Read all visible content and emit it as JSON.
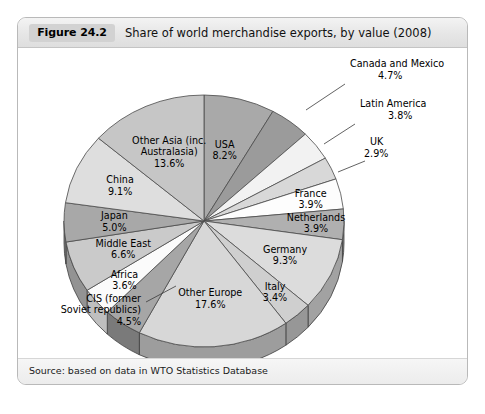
{
  "figure": {
    "number_label": "Figure 24.2",
    "title": "Share of world merchandise exports, by value (2008)",
    "source": "Source: based on data in WTO Statistics Database"
  },
  "chart_data": {
    "type": "pie",
    "title": "Share of world merchandise exports, by value (2008)",
    "value_unit": "%",
    "style": "3d-pie",
    "start_angle_deg": 0,
    "direction": "clockwise",
    "legend": "none (direct labels)",
    "categories": [
      "USA",
      "Canada and Mexico",
      "Latin America",
      "UK",
      "France",
      "Netherlands",
      "Germany",
      "Italy",
      "Other Europe",
      "CIS (former Soviet republics)",
      "Africa",
      "Middle East",
      "Japan",
      "China",
      "Other Asia (inc. Australasia)"
    ],
    "values": [
      8.2,
      4.7,
      3.8,
      2.9,
      3.9,
      3.9,
      9.3,
      3.4,
      17.6,
      4.5,
      3.6,
      6.6,
      5.0,
      9.1,
      13.6
    ],
    "slices": [
      {
        "name": "USA",
        "value": 8.2,
        "value_text": "8.2%",
        "label_lines": [
          "USA",
          "8.2%"
        ],
        "color": "#a9a9a9",
        "side_color": "#7d7d7d",
        "placement": "inside"
      },
      {
        "name": "Canada and Mexico",
        "value": 4.7,
        "value_text": "4.7%",
        "label_lines": [
          "Canada and Mexico",
          "4.7%"
        ],
        "color": "#9b9b9b",
        "side_color": "#717171",
        "placement": "callout"
      },
      {
        "name": "Latin America",
        "value": 3.8,
        "value_text": "3.8%",
        "label_lines": [
          "Latin America",
          "3.8%"
        ],
        "color": "#f2f2f2",
        "side_color": "#b7b7b7",
        "placement": "callout"
      },
      {
        "name": "UK",
        "value": 2.9,
        "value_text": "2.9%",
        "label_lines": [
          "UK",
          "2.9%"
        ],
        "color": "#d8d8d8",
        "side_color": "#9e9e9e",
        "placement": "callout"
      },
      {
        "name": "France",
        "value": 3.9,
        "value_text": "3.9%",
        "label_lines": [
          "France",
          "3.9%"
        ],
        "color": "#fdfdfd",
        "side_color": "#c0c0c0",
        "placement": "inside"
      },
      {
        "name": "Netherlands",
        "value": 3.9,
        "value_text": "3.9%",
        "label_lines": [
          "Netherlands",
          "3.9%"
        ],
        "color": "#b0b0b0",
        "side_color": "#848484",
        "placement": "inside"
      },
      {
        "name": "Germany",
        "value": 9.3,
        "value_text": "9.3%",
        "label_lines": [
          "Germany",
          "9.3%"
        ],
        "color": "#dcdcdc",
        "side_color": "#a2a2a2",
        "placement": "inside"
      },
      {
        "name": "Italy",
        "value": 3.4,
        "value_text": "3.4%",
        "label_lines": [
          "Italy",
          "3.4%"
        ],
        "color": "#cfcfcf",
        "side_color": "#979797",
        "placement": "inside"
      },
      {
        "name": "Other Europe",
        "value": 17.6,
        "value_text": "17.6%",
        "label_lines": [
          "Other Europe",
          "17.6%"
        ],
        "color": "#d7d7d7",
        "side_color": "#9d9d9d",
        "placement": "inside"
      },
      {
        "name": "CIS (former Soviet republics)",
        "value": 4.5,
        "value_text": "4.5%",
        "label_lines": [
          "CIS (former",
          "Soviet republics)",
          "4.5%"
        ],
        "color": "#a6a6a6",
        "side_color": "#7a7a7a",
        "placement": "callout"
      },
      {
        "name": "Africa",
        "value": 3.6,
        "value_text": "3.6%",
        "label_lines": [
          "Africa",
          "3.6%"
        ],
        "color": "#fbfbfb",
        "side_color": "#bfbfbf",
        "placement": "inside"
      },
      {
        "name": "Middle East",
        "value": 6.6,
        "value_text": "6.6%",
        "label_lines": [
          "Middle East",
          "6.6%"
        ],
        "color": "#cacaca",
        "side_color": "#939393",
        "placement": "inside"
      },
      {
        "name": "Japan",
        "value": 5.0,
        "value_text": "5.0%",
        "label_lines": [
          "Japan",
          "5.0%"
        ],
        "color": "#a8a8a8",
        "side_color": "#7c7c7c",
        "placement": "inside"
      },
      {
        "name": "China",
        "value": 9.1,
        "value_text": "9.1%",
        "label_lines": [
          "China",
          "9.1%"
        ],
        "color": "#dedede",
        "side_color": "#a4a4a4",
        "placement": "inside"
      },
      {
        "name": "Other Asia (inc. Australasia)",
        "value": 13.6,
        "value_text": "13.6%",
        "label_lines": [
          "Other Asia (inc.",
          "Australasia)",
          "13.6%"
        ],
        "color": "#c6c6c6",
        "side_color": "#909090",
        "placement": "inside"
      }
    ]
  },
  "colors": {
    "card_border": "#b9b9b9",
    "header_bg": "#e6e6e6",
    "figure_tag_bg": "#d2d2d2",
    "slice_outline": "#4a4a4a",
    "text": "#000000"
  }
}
